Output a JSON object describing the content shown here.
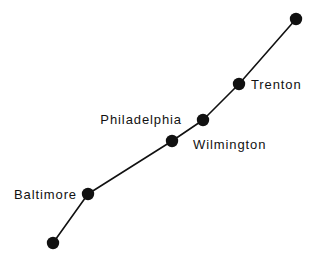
{
  "figure": {
    "background_color": "#ffffff",
    "ink_color": "#111111",
    "width": 320,
    "height": 259
  },
  "chart_data": {
    "type": "line",
    "title": "",
    "subtitle": "",
    "xlabel": "",
    "ylabel": "",
    "grid": false,
    "legend": "none",
    "axis_visible": false,
    "xlim": [
      0,
      320
    ],
    "ylim": [
      0,
      259
    ],
    "series": [
      {
        "name": "corridor-route",
        "line_color": "#111111",
        "line_width": 1.6,
        "marker": "filled-circle",
        "marker_color": "#111111",
        "marker_radius": 6.2,
        "points": [
          {
            "id": "node-1",
            "x": 53,
            "y": 243,
            "label": "",
            "label_position": "none"
          },
          {
            "id": "node-2",
            "x": 88,
            "y": 194,
            "label": "Baltimore",
            "label_position": "left"
          },
          {
            "id": "node-3",
            "x": 172,
            "y": 141,
            "label": "Philadelphia",
            "label_position": "upper-left"
          },
          {
            "id": "node-4",
            "x": 203,
            "y": 120,
            "label": "Wilmington",
            "label_position": "lower-right"
          },
          {
            "id": "node-5",
            "x": 239,
            "y": 84,
            "label": "Trenton",
            "label_position": "right"
          },
          {
            "id": "node-6",
            "x": 296,
            "y": 19,
            "label": "",
            "label_position": "none"
          }
        ]
      }
    ]
  },
  "labels": [
    {
      "name": "baltimore",
      "text": "Baltimore",
      "x": 77,
      "y": 194,
      "anchor": "end"
    },
    {
      "name": "philadelphia",
      "text": "Philadelphia",
      "x": 182,
      "y": 119,
      "anchor": "end"
    },
    {
      "name": "wilmington",
      "text": "Wilmington",
      "x": 193,
      "y": 144,
      "anchor": "start"
    },
    {
      "name": "trenton",
      "text": "Trenton",
      "x": 251,
      "y": 84,
      "anchor": "start"
    }
  ]
}
